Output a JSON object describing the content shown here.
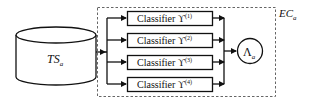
{
  "diagram": {
    "data_store": {
      "label": "TS",
      "subscript": "a"
    },
    "ensemble": {
      "label": "EC",
      "subscript": "a"
    },
    "classifiers": [
      {
        "prefix": "Classifier",
        "symbol": "ϒ",
        "superscript": "(1)"
      },
      {
        "prefix": "Classifier",
        "symbol": "ϒ",
        "superscript": "(2)"
      },
      {
        "prefix": "Classifier",
        "symbol": "ϒ",
        "superscript": "(3)"
      },
      {
        "prefix": "Classifier",
        "symbol": "ϒ",
        "superscript": "(4)"
      }
    ],
    "combiner": {
      "symbol": "Λ",
      "subscript": "a"
    },
    "colors": {
      "stroke": "#111111",
      "dashed": "#666666",
      "background": "#ffffff"
    }
  }
}
